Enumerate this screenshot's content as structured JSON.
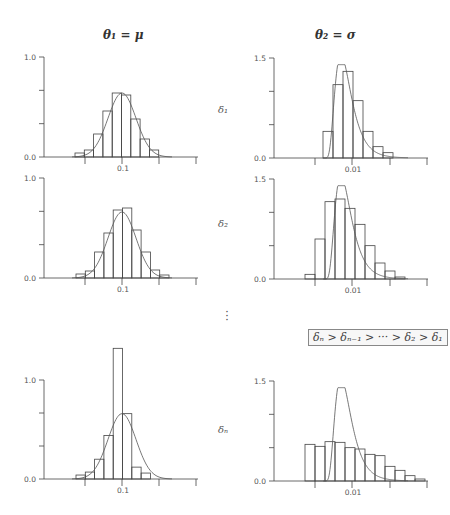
{
  "figure": {
    "column_titles": [
      "θ₁ = μ",
      "θ₂ = σ"
    ],
    "row_labels": [
      "δ₁",
      "δ₂",
      "δₙ"
    ],
    "ellipsis": "⋮",
    "legend_text": "δₙ > δₙ₋₁ > ··· > δ₂ > δ₁"
  },
  "chart_data": [
    {
      "type": "bar",
      "panel": "row1-col1",
      "title": "θ₁ = μ",
      "row_label": "δ₁",
      "xlabel": "",
      "ylabel": "",
      "ylim": [
        0,
        1.0
      ],
      "x_tick_labels": [
        "",
        "0.1",
        "",
        ""
      ],
      "y_tick_labels": [
        "0.0",
        "",
        "",
        "1.0"
      ],
      "bin_start_px": 75,
      "bin_width_px": 9.3,
      "values": [
        0.04,
        0.07,
        0.23,
        0.46,
        0.64,
        0.62,
        0.38,
        0.18,
        0.07
      ],
      "overlay": {
        "type": "normal-curve",
        "peak": 0.64,
        "center_px": 122,
        "sd_px": 14
      }
    },
    {
      "type": "bar",
      "panel": "row1-col2",
      "title": "θ₂ = σ",
      "row_label": "δ₁",
      "ylim": [
        0,
        1.5
      ],
      "x_tick_labels": [
        "",
        "0.01",
        "",
        ""
      ],
      "y_tick_labels": [
        "0.0",
        "",
        "",
        "1.5"
      ],
      "bin_start_px": 323,
      "bin_width_px": 10,
      "values": [
        0.4,
        1.1,
        1.3,
        0.86,
        0.4,
        0.17,
        0.08
      ],
      "overlay": {
        "type": "skewed-curve",
        "peak": 1.4,
        "mode_px": 345
      }
    },
    {
      "type": "bar",
      "panel": "row2-col1",
      "row_label": "δ₂",
      "ylim": [
        0,
        1.0
      ],
      "x_tick_labels": [
        "",
        "0.1",
        "",
        ""
      ],
      "y_tick_labels": [
        "0.0",
        "",
        "",
        "1.0"
      ],
      "bin_start_px": 76,
      "bin_width_px": 9.3,
      "values": [
        0.04,
        0.07,
        0.26,
        0.45,
        0.68,
        0.7,
        0.48,
        0.26,
        0.08,
        0.03
      ],
      "overlay": {
        "type": "normal-curve",
        "peak": 0.66,
        "center_px": 122,
        "sd_px": 14
      }
    },
    {
      "type": "bar",
      "panel": "row2-col2",
      "row_label": "δ₂",
      "ylim": [
        0,
        1.5
      ],
      "x_tick_labels": [
        "",
        "0.01",
        "",
        ""
      ],
      "y_tick_labels": [
        "0.0",
        "",
        "",
        "1.5"
      ],
      "bin_start_px": 305,
      "bin_width_px": 10,
      "values": [
        0.07,
        0.6,
        1.16,
        1.2,
        1.06,
        0.82,
        0.5,
        0.24,
        0.12,
        0.03
      ],
      "overlay": {
        "type": "skewed-curve",
        "peak": 1.4,
        "mode_px": 345
      }
    },
    {
      "type": "bar",
      "panel": "row3-col1",
      "row_label": "δₙ",
      "ylim": [
        0,
        1.0
      ],
      "x_tick_labels": [
        "",
        "0.1",
        "",
        ""
      ],
      "y_tick_labels": [
        "0.0",
        "",
        "",
        "1.0"
      ],
      "bin_start_px": 76,
      "bin_width_px": 9.3,
      "values": [
        0.04,
        0.07,
        0.2,
        0.44,
        1.32,
        0.66,
        0.12,
        0.06
      ],
      "overlay": {
        "type": "normal-curve",
        "peak": 0.66,
        "center_px": 122,
        "sd_px": 14
      }
    },
    {
      "type": "bar",
      "panel": "row3-col2",
      "row_label": "δₙ",
      "ylim": [
        0,
        1.5
      ],
      "x_tick_labels": [
        "",
        "0.01",
        "",
        ""
      ],
      "y_tick_labels": [
        "0.0",
        "",
        "",
        "1.5"
      ],
      "bin_start_px": 305,
      "bin_width_px": 10,
      "values": [
        0.55,
        0.52,
        0.59,
        0.58,
        0.5,
        0.48,
        0.4,
        0.38,
        0.22,
        0.16,
        0.08,
        0.03
      ],
      "overlay": {
        "type": "skewed-curve",
        "peak": 1.4,
        "mode_px": 345
      }
    }
  ]
}
